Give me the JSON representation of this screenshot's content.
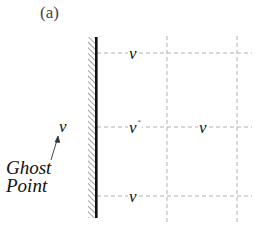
{
  "figure": {
    "panel_label": "(a)",
    "colors": {
      "wall": "#111111",
      "hatch": "#666666",
      "grid_dashed": "#b0b0b0",
      "text": "#111111"
    },
    "wall": {
      "x": 96,
      "y_top": 37,
      "y_bottom": 218
    },
    "grid": {
      "horizontal_lines_y": [
        53,
        127,
        196
      ],
      "vertical_lines_x": [
        167,
        237
      ]
    },
    "nodes": [
      {
        "label": "v",
        "superscript": "",
        "position": "top-row, first column"
      },
      {
        "label": "v",
        "superscript": "*",
        "position": "middle-row, first column"
      },
      {
        "label": "v",
        "superscript": "",
        "position": "middle-row, second column"
      },
      {
        "label": "v",
        "superscript": "",
        "position": "bottom-row, first column"
      }
    ],
    "ghost": {
      "label": "v",
      "annotation_line1": "Ghost",
      "annotation_line2": "Point"
    }
  }
}
